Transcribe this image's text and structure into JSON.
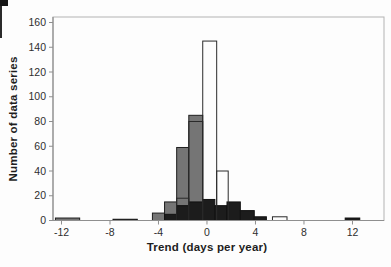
{
  "chart_data": {
    "type": "bar",
    "subtype": "overlaid-histogram",
    "title": "",
    "xlabel": "Trend (days per year)",
    "ylabel": "Number of data series",
    "xlim": [
      -12.7,
      14.6
    ],
    "ylim": [
      0,
      160
    ],
    "x_ticks": [
      -12,
      -8,
      -4,
      0,
      4,
      8,
      12
    ],
    "y_ticks": [
      0,
      20,
      40,
      60,
      80,
      100,
      120,
      140,
      160
    ],
    "grid": false,
    "legend_position": "none",
    "frame_color": "#b3b3b3",
    "axis_color": "#8f8f8f",
    "series": [
      {
        "name": "gray-filled",
        "fill": "#757575",
        "stroke": "#1f1f1f",
        "bars": [
          {
            "x0": -12.5,
            "x1": -10.5,
            "y": 2
          },
          {
            "x0": -4.5,
            "x1": -3.5,
            "y": 6
          },
          {
            "x0": -3.5,
            "x1": -2.5,
            "y": 15
          },
          {
            "x0": -2.5,
            "x1": -1.5,
            "y": 59
          },
          {
            "x0": -1.5,
            "x1": -0.35,
            "y": 85
          }
        ]
      },
      {
        "name": "black-filled",
        "fill": "#1c1c1c",
        "stroke": "#111111",
        "bars": [
          {
            "x0": -7.75,
            "x1": -5.75,
            "y": 1
          },
          {
            "x0": -3.5,
            "x1": -2.5,
            "y": 5
          },
          {
            "x0": -2.5,
            "x1": -1.5,
            "y": 12
          },
          {
            "x0": -1.5,
            "x1": -0.35,
            "y": 15
          },
          {
            "x0": -0.35,
            "x1": 0.65,
            "y": 17
          },
          {
            "x0": 0.65,
            "x1": 1.65,
            "y": 12
          },
          {
            "x0": 1.65,
            "x1": 2.75,
            "y": 15
          },
          {
            "x0": 2.75,
            "x1": 3.9,
            "y": 8
          },
          {
            "x0": 3.9,
            "x1": 4.9,
            "y": 3
          },
          {
            "x0": 11.4,
            "x1": 12.6,
            "y": 2
          }
        ]
      },
      {
        "name": "white-outline",
        "fill": "none",
        "stroke": "#2a2a2a",
        "bars": [
          {
            "x0": -2.5,
            "x1": -1.5,
            "y": 18
          },
          {
            "x0": -1.5,
            "x1": -0.35,
            "y": 80
          },
          {
            "x0": -0.35,
            "x1": 0.8,
            "y": 145
          },
          {
            "x0": 0.8,
            "x1": 1.75,
            "y": 40
          },
          {
            "x0": 5.4,
            "x1": 6.6,
            "y": 3
          }
        ]
      }
    ]
  }
}
